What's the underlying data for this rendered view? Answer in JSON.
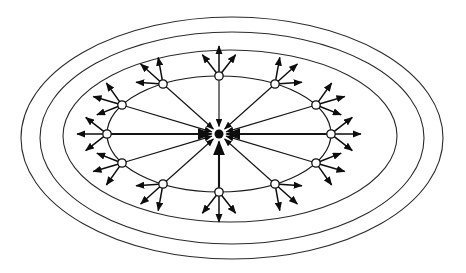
{
  "figure": {
    "title": "Radial hub-and-spoke network over concentric contour rings",
    "background_color": "#ffffff",
    "stroke_color": "#0d0d0d",
    "width": 466,
    "height": 273
  },
  "diagram": {
    "type": "radial-network",
    "center": {
      "cx": 219,
      "cy": 134,
      "label": "hub",
      "marker": "converging-arrowheads"
    },
    "contours": [
      {
        "name": "contour-ring-outer",
        "cx": 232,
        "cy": 138,
        "rx": 211,
        "ry": 121
      },
      {
        "name": "contour-ring-middle",
        "cx": 232,
        "cy": 138,
        "rx": 192,
        "ry": 106
      },
      {
        "name": "contour-ring-inner",
        "cx": 230,
        "cy": 136,
        "rx": 167,
        "ry": 86
      }
    ],
    "node_ring": {
      "name": "node-ellipse",
      "cx": 219,
      "cy": 134,
      "rx": 112,
      "ry": 58
    },
    "node_count": 12,
    "node_radius": 4.2,
    "nodes": [
      {
        "id": "n01",
        "angle_deg": 0,
        "x": 331,
        "y": 134,
        "out_arrows": 3
      },
      {
        "id": "n02",
        "angle_deg": 30,
        "x": 316,
        "y": 105,
        "out_arrows": 3
      },
      {
        "id": "n03",
        "angle_deg": 60,
        "x": 275,
        "y": 84,
        "out_arrows": 3
      },
      {
        "id": "n04",
        "angle_deg": 90,
        "x": 219,
        "y": 76,
        "out_arrows": 3
      },
      {
        "id": "n05",
        "angle_deg": 120,
        "x": 163,
        "y": 84,
        "out_arrows": 3
      },
      {
        "id": "n06",
        "angle_deg": 150,
        "x": 122,
        "y": 105,
        "out_arrows": 3
      },
      {
        "id": "n07",
        "angle_deg": 180,
        "x": 107,
        "y": 134,
        "out_arrows": 3
      },
      {
        "id": "n08",
        "angle_deg": 210,
        "x": 122,
        "y": 163,
        "out_arrows": 3
      },
      {
        "id": "n09",
        "angle_deg": 240,
        "x": 163,
        "y": 184,
        "out_arrows": 3
      },
      {
        "id": "n10",
        "angle_deg": 270,
        "x": 219,
        "y": 192,
        "out_arrows": 3
      },
      {
        "id": "n11",
        "angle_deg": 300,
        "x": 275,
        "y": 184,
        "out_arrows": 3
      },
      {
        "id": "n12",
        "angle_deg": 330,
        "x": 316,
        "y": 163,
        "out_arrows": 3
      }
    ],
    "inward_edges_label": "node-to-hub arrow",
    "outward_edges_label": "node outward arrow",
    "arrow_head": {
      "length": 7,
      "width": 5,
      "fill": "#0d0d0d"
    }
  }
}
